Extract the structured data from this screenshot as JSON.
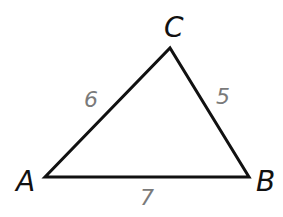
{
  "figure": {
    "type": "triangle",
    "vertices": {
      "A": {
        "label": "A",
        "x": 45,
        "y": 177
      },
      "B": {
        "label": "B",
        "x": 249,
        "y": 177
      },
      "C": {
        "label": "C",
        "x": 170,
        "y": 48
      }
    },
    "sides": {
      "AC": {
        "length": "6"
      },
      "CB": {
        "length": "5"
      },
      "AB": {
        "length": "7"
      }
    },
    "colors": {
      "stroke": "#111111",
      "vertex_label": "#111111",
      "side_label": "#7a7a7a",
      "background": "#ffffff"
    }
  }
}
